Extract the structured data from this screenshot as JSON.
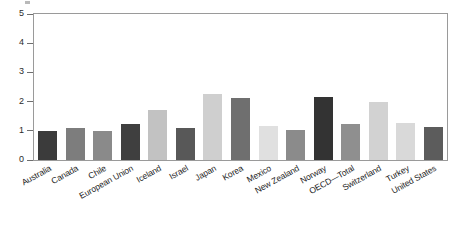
{
  "chart_data": {
    "type": "bar",
    "title": "",
    "subtitle": "",
    "xlabel": "",
    "ylabel": "",
    "ylim": [
      0,
      5
    ],
    "yticks": [
      0,
      1,
      2,
      3,
      4,
      5
    ],
    "ytick_labels": [
      "0",
      "1",
      "2",
      "3",
      "4",
      "5"
    ],
    "grid": false,
    "legend": null,
    "categories": [
      "Australia",
      "Canada",
      "Chile",
      "European Union",
      "Iceland",
      "Israel",
      "Japan",
      "Korea",
      "Mexico",
      "New Zealand",
      "Norway",
      "OECD—Total",
      "Switzerland",
      "Turkey",
      "United States"
    ],
    "values": [
      1.0,
      1.1,
      1.0,
      1.25,
      1.7,
      1.1,
      2.25,
      2.12,
      1.15,
      1.03,
      2.15,
      1.25,
      2.0,
      1.27,
      1.12
    ],
    "bar_colors": [
      "#3b3b3b",
      "#7d7d7d",
      "#8a8a8a",
      "#3f3f3f",
      "#c2c2c2",
      "#585858",
      "#cfcfcf",
      "#6f6f6f",
      "#e0e0e0",
      "#8b8b8b",
      "#333333",
      "#8f8f8f",
      "#d2d2d2",
      "#d9d9d9",
      "#5c5c5c"
    ],
    "axis_color": "#9a9a9a",
    "tick_color": "#6e6e6e",
    "text_color": "#1c1c1c",
    "background": "#ffffff"
  }
}
